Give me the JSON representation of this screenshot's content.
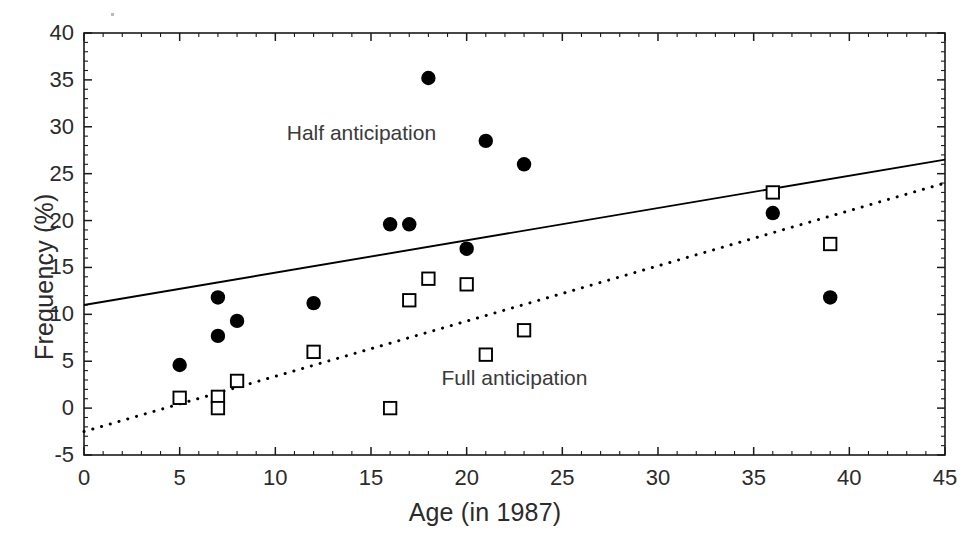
{
  "chart_data": {
    "type": "scatter",
    "title": "",
    "xlabel": "Age (in 1987)",
    "ylabel": "Frequency (%)",
    "xlim": [
      0,
      45
    ],
    "ylim": [
      -5,
      40
    ],
    "xticks": [
      0,
      5,
      10,
      15,
      20,
      25,
      30,
      35,
      40,
      45
    ],
    "yticks": [
      -5,
      0,
      5,
      10,
      15,
      20,
      25,
      30,
      35,
      40
    ],
    "xtick_labels": [
      "0",
      "5",
      "10",
      "15",
      "20",
      "25",
      "30",
      "35",
      "40",
      "45"
    ],
    "ytick_labels": [
      "-5",
      "0",
      "5",
      "10",
      "15",
      "20",
      "25",
      "30",
      "35",
      "40"
    ],
    "grid": false,
    "legend_position": "inline-annotations",
    "minor_ticks": true,
    "series": [
      {
        "name": "Half anticipation",
        "marker": "filled-circle",
        "color": "#000000",
        "annotation": "Half anticipation",
        "annotation_x": 14.5,
        "annotation_y": 29.3,
        "points": [
          {
            "x": 5,
            "y": 4.6
          },
          {
            "x": 7,
            "y": 11.8
          },
          {
            "x": 7,
            "y": 7.7
          },
          {
            "x": 8,
            "y": 9.3
          },
          {
            "x": 12,
            "y": 11.2
          },
          {
            "x": 16,
            "y": 19.6
          },
          {
            "x": 17,
            "y": 19.6
          },
          {
            "x": 18,
            "y": 35.2
          },
          {
            "x": 20,
            "y": 17.0
          },
          {
            "x": 21,
            "y": 28.5
          },
          {
            "x": 23,
            "y": 26.0
          },
          {
            "x": 36,
            "y": 20.8
          },
          {
            "x": 39,
            "y": 11.8
          }
        ],
        "fit_line": {
          "style": "solid",
          "x0": 0,
          "y0": 11.0,
          "x1": 45,
          "y1": 26.5
        }
      },
      {
        "name": "Full anticipation",
        "marker": "open-square",
        "color": "#000000",
        "annotation": "Full anticipation",
        "annotation_x": 22.5,
        "annotation_y": 3.2,
        "points": [
          {
            "x": 5,
            "y": 1.1
          },
          {
            "x": 7,
            "y": 1.2
          },
          {
            "x": 7,
            "y": 0.0
          },
          {
            "x": 8,
            "y": 2.9
          },
          {
            "x": 12,
            "y": 6.0
          },
          {
            "x": 16,
            "y": 0.0
          },
          {
            "x": 17,
            "y": 11.5
          },
          {
            "x": 18,
            "y": 13.8
          },
          {
            "x": 20,
            "y": 13.2
          },
          {
            "x": 21,
            "y": 5.7
          },
          {
            "x": 23,
            "y": 8.3
          },
          {
            "x": 36,
            "y": 23.0
          },
          {
            "x": 39,
            "y": 17.5
          }
        ],
        "fit_line": {
          "style": "dotted",
          "x0": 0,
          "y0": -2.5,
          "x1": 45,
          "y1": 24.0
        }
      }
    ]
  },
  "axes": {
    "x_title": "Age (in 1987)",
    "y_title": "Frequency (%)"
  },
  "annotations": {
    "half": "Half anticipation",
    "full": "Full anticipation"
  }
}
